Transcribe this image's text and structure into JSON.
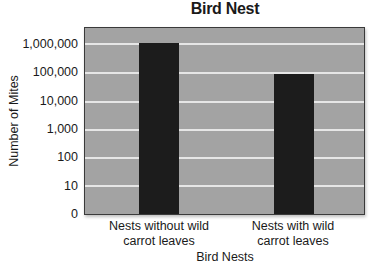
{
  "chart_data": {
    "type": "bar",
    "title": "Bird Nest",
    "xlabel": "Bird Nests",
    "ylabel": "Number of Mites",
    "yscale": "log",
    "categories": [
      "Nests without wild carrot leaves",
      "Nests with wild carrot leaves"
    ],
    "category_lines": [
      [
        "Nests without wild",
        "carrot leaves"
      ],
      [
        "Nests with wild",
        "carrot leaves"
      ]
    ],
    "values": [
      1000000,
      80000
    ],
    "yticks": [
      "0",
      "10",
      "100",
      "1,000",
      "10,000",
      "100,000",
      "1,000,000"
    ],
    "ytick_values": [
      0,
      10,
      100,
      1000,
      10000,
      100000,
      1000000
    ],
    "grid": true,
    "legend": null,
    "colors": {
      "bar": "#1c1c1c",
      "plot_background": "#a3a3a3",
      "gridline": "#e6e6e6"
    }
  }
}
